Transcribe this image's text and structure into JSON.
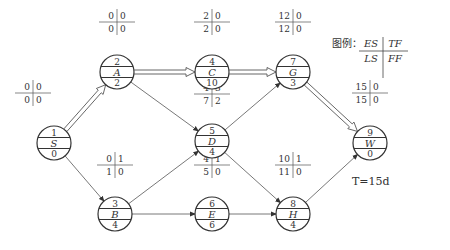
{
  "legend": {
    "prefix": "图例：",
    "es": "ES",
    "tf": "TF",
    "ls": "LS",
    "ff": "FF"
  },
  "total_time": "T=15d",
  "nodes": [
    {
      "id": "S",
      "num": "1",
      "dur": "0",
      "x": 54,
      "y": 143,
      "es": "0",
      "tf": "0",
      "ls": "0",
      "ff": "0",
      "lx": 33,
      "ly": 93
    },
    {
      "id": "A",
      "num": "2",
      "dur": "2",
      "x": 117,
      "y": 72,
      "es": "0",
      "tf": "0",
      "ls": "0",
      "ff": "0",
      "lx": 117,
      "ly": 22
    },
    {
      "id": "B",
      "num": "3",
      "dur": "4",
      "x": 115,
      "y": 214,
      "es": "0",
      "tf": "1",
      "ls": "1",
      "ff": "0",
      "lx": 115,
      "ly": 165
    },
    {
      "id": "C",
      "num": "4",
      "dur": "10",
      "x": 212,
      "y": 72,
      "es": "2",
      "tf": "0",
      "ls": "2",
      "ff": "0",
      "lx": 212,
      "ly": 22
    },
    {
      "id": "D",
      "num": "5",
      "dur": "4",
      "x": 212,
      "y": 141,
      "es": "4",
      "tf": "3",
      "ls": "7",
      "ff": "2",
      "lx": 212,
      "ly": 94
    },
    {
      "id": "E",
      "num": "6",
      "dur": "6",
      "x": 212,
      "y": 214,
      "es": "4",
      "tf": "1",
      "ls": "5",
      "ff": "0",
      "lx": 212,
      "ly": 165
    },
    {
      "id": "G",
      "num": "7",
      "dur": "3",
      "x": 293,
      "y": 72,
      "es": "12",
      "tf": "0",
      "ls": "12",
      "ff": "0",
      "lx": 293,
      "ly": 22
    },
    {
      "id": "H",
      "num": "8",
      "dur": "4",
      "x": 293,
      "y": 214,
      "es": "10",
      "tf": "1",
      "ls": "11",
      "ff": "0",
      "lx": 293,
      "ly": 165
    },
    {
      "id": "W",
      "num": "9",
      "dur": "0",
      "x": 370,
      "y": 143,
      "es": "15",
      "tf": "0",
      "ls": "15",
      "ff": "0",
      "lx": 370,
      "ly": 93
    }
  ],
  "edges": [
    {
      "from": "S",
      "to": "A",
      "critical": true
    },
    {
      "from": "S",
      "to": "B",
      "critical": false
    },
    {
      "from": "A",
      "to": "C",
      "critical": true
    },
    {
      "from": "A",
      "to": "D",
      "critical": false
    },
    {
      "from": "B",
      "to": "D",
      "critical": false
    },
    {
      "from": "B",
      "to": "E",
      "critical": false
    },
    {
      "from": "C",
      "to": "G",
      "critical": true
    },
    {
      "from": "D",
      "to": "G",
      "critical": false
    },
    {
      "from": "D",
      "to": "H",
      "critical": false
    },
    {
      "from": "E",
      "to": "H",
      "critical": false
    },
    {
      "from": "G",
      "to": "W",
      "critical": true
    },
    {
      "from": "H",
      "to": "W",
      "critical": false
    }
  ]
}
